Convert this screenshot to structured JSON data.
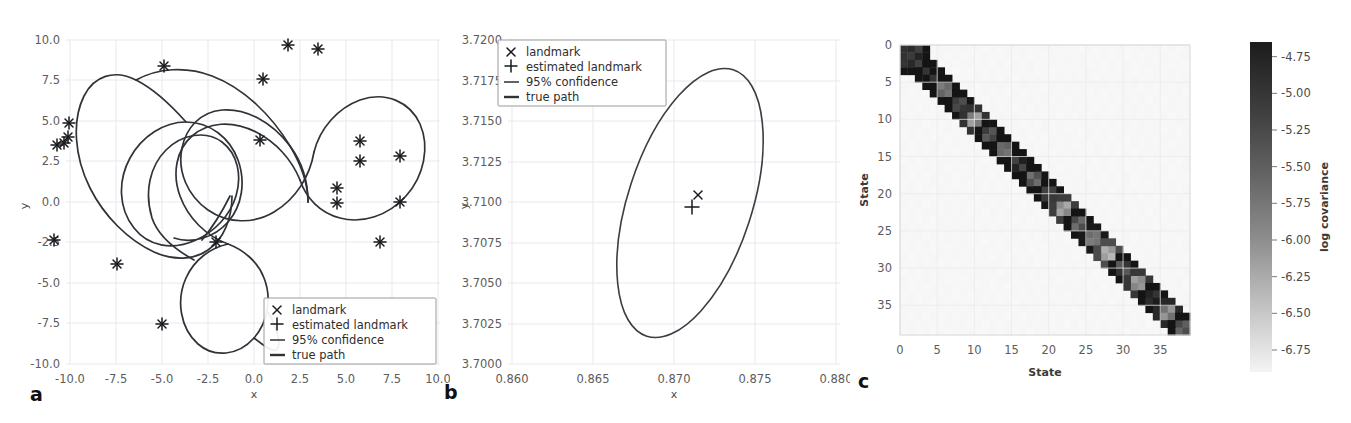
{
  "figure": {
    "panels": [
      "a",
      "b",
      "c"
    ]
  },
  "panel_a": {
    "label": "a",
    "xlabel": "x",
    "ylabel": "y",
    "xticks": [
      "-10.0",
      "-7.5",
      "-5.0",
      "-2.5",
      "0.0",
      "2.5",
      "5.0",
      "7.5",
      "10.0"
    ],
    "yticks": [
      "10.0",
      "7.5",
      "5.0",
      "2.5",
      "0.0",
      "-2.5",
      "-5.0",
      "-7.5",
      "-10.0"
    ],
    "legend": [
      {
        "marker": "x-marker",
        "label": "landmark"
      },
      {
        "marker": "plus-marker",
        "label": "estimated landmark"
      },
      {
        "marker": "thin-line",
        "label": "95% confidence"
      },
      {
        "marker": "thick-line",
        "label": "true path"
      }
    ]
  },
  "panel_b": {
    "label": "b",
    "xlabel": "x",
    "ylabel": "y",
    "xticks": [
      "0.860",
      "0.865",
      "0.870",
      "0.875",
      "0.880"
    ],
    "yticks": [
      "3.7200",
      "3.7175",
      "3.7150",
      "3.7125",
      "3.7100",
      "3.7075",
      "3.7050",
      "3.7025",
      "3.7000"
    ],
    "legend": [
      {
        "marker": "x-marker",
        "label": "landmark"
      },
      {
        "marker": "plus-marker",
        "label": "estimated landmark"
      },
      {
        "marker": "thin-line",
        "label": "95% confidence"
      },
      {
        "marker": "thick-line",
        "label": "true path"
      }
    ]
  },
  "panel_c": {
    "label": "c",
    "xlabel": "State",
    "ylabel": "State",
    "xticks": [
      "0",
      "5",
      "10",
      "15",
      "20",
      "25",
      "30",
      "35"
    ],
    "yticks": [
      "0",
      "5",
      "10",
      "15",
      "20",
      "25",
      "30",
      "35"
    ],
    "colorbar_label": "log covariance",
    "colorbar_ticks": [
      "-4.75",
      "-5.00",
      "-5.25",
      "-5.50",
      "-5.75",
      "-6.00",
      "-6.25",
      "-6.50",
      "-6.75"
    ]
  },
  "colors": {
    "path": "#2f3237",
    "marker": "#16181c",
    "grid": "#e9e9ef",
    "tick_text": "#5c5c5c",
    "heat_dark": "#2b2b2b",
    "heat_light": "#f7f7f7",
    "background": "#ffffff"
  },
  "chart_data": [
    {
      "type": "scatter",
      "panel": "a",
      "title": "",
      "xlabel": "x",
      "ylabel": "y",
      "xlim": [
        -11.0,
        11.0
      ],
      "ylim": [
        -11.0,
        11.0
      ],
      "grid": true,
      "legend_position": "lower-right",
      "landmarks": [
        {
          "x": -9.55,
          "y": 4.35
        },
        {
          "x": -10.2,
          "y": 3.0
        },
        {
          "x": -9.85,
          "y": 3.1
        },
        {
          "x": -9.6,
          "y": 3.35
        },
        {
          "x": -10.35,
          "y": -2.45
        },
        {
          "x": -6.9,
          "y": -3.9
        },
        {
          "x": -4.35,
          "y": 8.6
        },
        {
          "x": -4.45,
          "y": -7.55
        },
        {
          "x": -1.5,
          "y": -2.6
        },
        {
          "x": 0.9,
          "y": 3.75
        },
        {
          "x": 1.05,
          "y": 7.8
        },
        {
          "x": 2.4,
          "y": 9.9
        },
        {
          "x": 4.0,
          "y": 9.65
        },
        {
          "x": 5.05,
          "y": -0.1
        },
        {
          "x": 5.05,
          "y": 0.85
        },
        {
          "x": 6.3,
          "y": 3.7
        },
        {
          "x": 6.3,
          "y": 2.45
        },
        {
          "x": 7.4,
          "y": -2.5
        },
        {
          "x": 8.5,
          "y": 2.8
        },
        {
          "x": 8.5,
          "y": -0.05
        }
      ],
      "estimated_landmarks": [
        {
          "x": -9.55,
          "y": 4.35
        },
        {
          "x": -10.2,
          "y": 3.0
        },
        {
          "x": -9.85,
          "y": 3.1
        },
        {
          "x": -9.6,
          "y": 3.35
        },
        {
          "x": -10.35,
          "y": -2.45
        },
        {
          "x": -6.9,
          "y": -3.9
        },
        {
          "x": -4.35,
          "y": 8.6
        },
        {
          "x": -4.45,
          "y": -7.55
        },
        {
          "x": -1.5,
          "y": -2.6
        },
        {
          "x": 0.9,
          "y": 3.75
        },
        {
          "x": 1.05,
          "y": 7.8
        },
        {
          "x": 2.4,
          "y": 9.9
        },
        {
          "x": 4.0,
          "y": 9.65
        },
        {
          "x": 5.05,
          "y": -0.1
        },
        {
          "x": 5.05,
          "y": 0.85
        },
        {
          "x": 6.3,
          "y": 3.7
        },
        {
          "x": 6.3,
          "y": 2.45
        },
        {
          "x": 7.4,
          "y": -2.5
        },
        {
          "x": 8.5,
          "y": 2.8
        },
        {
          "x": 8.5,
          "y": -0.05
        }
      ],
      "true_path_description": "multi-loop closed trajectory with several self-intersections spanning roughly x in [-6.5, 9.5], y in [-8.5, 7.8]"
    },
    {
      "type": "scatter",
      "panel": "b",
      "title": "",
      "xlabel": "x",
      "ylabel": "y",
      "xlim": [
        0.8585,
        0.8815
      ],
      "ylim": [
        3.69975,
        3.72025
      ],
      "grid": true,
      "legend_position": "upper-left",
      "landmarks": [
        {
          "x": 0.87255,
          "y": 3.71072
        }
      ],
      "estimated_landmarks": [
        {
          "x": 0.87225,
          "y": 3.71002
        }
      ],
      "confidence_ellipse": {
        "center_x": 0.87215,
        "center_y": 3.71005,
        "semi_major": 0.00855,
        "semi_minor": 0.00345,
        "angle_deg": -72
      }
    },
    {
      "type": "heatmap",
      "panel": "c",
      "title": "",
      "xlabel": "State",
      "ylabel": "State",
      "xlim": [
        0,
        39
      ],
      "ylim": [
        0,
        39
      ],
      "n_states": 39,
      "grid": true,
      "colorbar": {
        "label": "log covariance",
        "vmin": -6.9,
        "vmax": -4.65,
        "ticks": [
          -4.75,
          -5.0,
          -5.25,
          -5.5,
          -5.75,
          -6.0,
          -6.25,
          -6.5,
          -6.75
        ],
        "reversed_gray": true
      },
      "structure": "block-diagonal: a 3x3 robot-pose block at the origin followed by 2x2 landmark blocks along the diagonal, off-diagonal near-zero (light)",
      "diagonal_blocks": [
        {
          "start": 0,
          "size": 3,
          "value": -4.95
        },
        {
          "start": 3,
          "size": 2,
          "value": -4.8
        },
        {
          "start": 5,
          "size": 2,
          "value": -5.55
        },
        {
          "start": 7,
          "size": 2,
          "value": -5.1
        },
        {
          "start": 9,
          "size": 2,
          "value": -5.85
        },
        {
          "start": 11,
          "size": 2,
          "value": -5.2
        },
        {
          "start": 13,
          "size": 2,
          "value": -5.5
        },
        {
          "start": 15,
          "size": 2,
          "value": -4.95
        },
        {
          "start": 17,
          "size": 2,
          "value": -5.4
        },
        {
          "start": 19,
          "size": 2,
          "value": -5.05
        },
        {
          "start": 21,
          "size": 2,
          "value": -5.95
        },
        {
          "start": 23,
          "size": 2,
          "value": -5.35
        },
        {
          "start": 25,
          "size": 2,
          "value": -5.6
        },
        {
          "start": 27,
          "size": 2,
          "value": -6.1
        },
        {
          "start": 29,
          "size": 2,
          "value": -5.15
        },
        {
          "start": 31,
          "size": 2,
          "value": -5.9
        },
        {
          "start": 33,
          "size": 2,
          "value": -4.85
        },
        {
          "start": 35,
          "size": 2,
          "value": -5.75
        },
        {
          "start": 37,
          "size": 2,
          "value": -5.3
        }
      ]
    }
  ]
}
